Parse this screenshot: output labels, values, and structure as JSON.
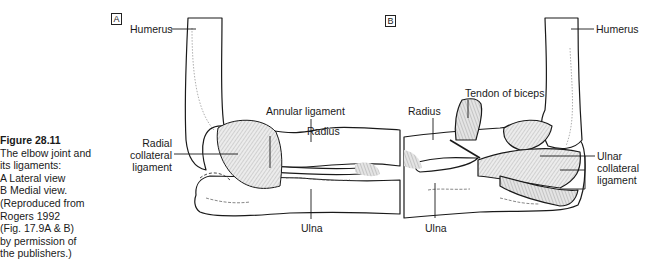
{
  "caption": {
    "title": "Figure 28.11",
    "lines": [
      "The elbow joint and",
      "its ligaments:",
      "A  Lateral view",
      "B  Medial view.",
      "(Reproduced from",
      "Rogers 1992",
      "(Fig. 17.9A & B)",
      "by permission of",
      "the publishers.)"
    ]
  },
  "panel_a": {
    "tag": "A",
    "view": "Lateral view",
    "labels": {
      "humerus": "Humerus",
      "annular_ligament": "Annular ligament",
      "radius": "Radius",
      "radial_collateral_1": "Radial",
      "radial_collateral_2": "collateral",
      "radial_collateral_3": "ligament",
      "ulna": "Ulna"
    }
  },
  "panel_b": {
    "tag": "B",
    "view": "Medial view",
    "labels": {
      "humerus": "Humerus",
      "tendon_of_biceps": "Tendon of biceps",
      "radius": "Radius",
      "ulnar_collateral_1": "Ulnar",
      "ulnar_collateral_2": "collateral",
      "ulnar_collateral_3": "ligament",
      "ulna": "Ulna"
    }
  },
  "colors": {
    "line": "#1a1a1a",
    "ligament_fill": "#d9d9d9",
    "bone_fill": "#ffffff"
  }
}
